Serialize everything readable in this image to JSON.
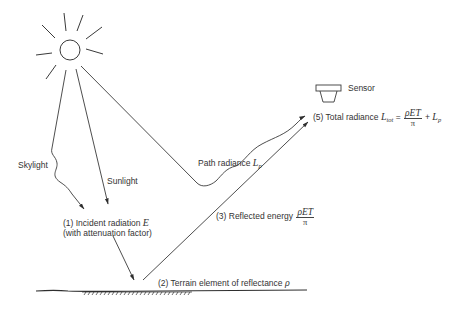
{
  "diagram": {
    "type": "remote-sensing-radiance-schematic",
    "labels": {
      "skylight": "Skylight",
      "sunlight": "Sunlight",
      "path_radiance_text": "Path radiance ",
      "path_radiance_symbol": "L",
      "path_radiance_sub": "p",
      "sensor": "Sensor",
      "total_radiance_prefix": "(5) Total radiance ",
      "total_symbol": "L",
      "total_sub": "tot",
      "equals": " = ",
      "frac_num": "ρET",
      "frac_den": "π",
      "plus": " + ",
      "lp_symbol": "L",
      "lp_sub": "p",
      "incident_line1_prefix": "(1) Incident radiation ",
      "incident_symbol": "E",
      "incident_line2": "(with attenuation factor)",
      "reflected_prefix": "(3) Reflected energy ",
      "reflected_num": "ρET",
      "reflected_den": "π",
      "terrain_prefix": "(2) Terrain element of reflectance ",
      "terrain_symbol": "ρ"
    },
    "colors": {
      "line": "#3a3a3a",
      "background": "#ffffff"
    }
  }
}
